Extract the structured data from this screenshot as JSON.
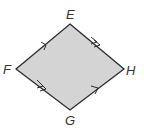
{
  "diagram": {
    "type": "quadrilateral",
    "shape": "parallelogram",
    "fill_color": "#d4d4d4",
    "stroke_color": "#2b2b2b",
    "vertices": [
      {
        "name": "E",
        "x": 70,
        "y": 24
      },
      {
        "name": "H",
        "x": 124,
        "y": 69
      },
      {
        "name": "G",
        "x": 70,
        "y": 110
      },
      {
        "name": "F",
        "x": 16,
        "y": 69
      }
    ],
    "labels": {
      "E": "E",
      "F": "F",
      "G": "G",
      "H": "H"
    },
    "sides": [
      {
        "segment": "FE",
        "arrow_marks": 1
      },
      {
        "segment": "EH",
        "arrow_marks": 2
      },
      {
        "segment": "FG",
        "arrow_marks": 2
      },
      {
        "segment": "GH",
        "arrow_marks": 1
      }
    ]
  }
}
